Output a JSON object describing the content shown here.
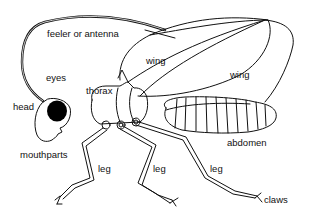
{
  "diagram": {
    "labels": {
      "feeler": "feeler or antenna",
      "wing_front": "wing",
      "wing_back": "wing",
      "eyes": "eyes",
      "thorax": "thorax",
      "head": "head",
      "mouthparts": "mouthparts",
      "abdomen": "abdomen",
      "leg_front": "leg",
      "leg_middle": "leg",
      "leg_back": "leg",
      "claws": "claws"
    },
    "colors": {
      "line": "#111111",
      "eye_fill": "#000000",
      "background": "#ffffff"
    }
  }
}
